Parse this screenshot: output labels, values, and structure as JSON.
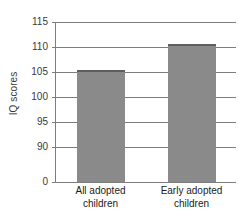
{
  "chart_data": {
    "type": "bar",
    "title": "",
    "subtitle": "",
    "xlabel": "",
    "ylabel": "IQ scores",
    "categories": [
      "All adopted children",
      "Early adopted children"
    ],
    "category_lines": [
      [
        "All adopted",
        "children"
      ],
      [
        "Early adopted",
        "children"
      ]
    ],
    "values": [
      105.4,
      110.6
    ],
    "ylim": [
      0,
      115
    ],
    "y_ticks": [
      "0",
      "90",
      "95",
      "100",
      "105",
      "110",
      "115"
    ],
    "y_tick_values": [
      0,
      90,
      95,
      100,
      105,
      110,
      115
    ],
    "grid": "horizontal",
    "legend": "none",
    "axis_break": "y-axis compressed between 0 and 90",
    "bar_color": "#8a8a8a",
    "bar_edge_color": "#5e5e5e",
    "axis_color": "#7d7d7d",
    "background_color": "#ffffff",
    "text_color": "#1a1a1a"
  },
  "axis": {
    "y_title": "IQ scores"
  }
}
